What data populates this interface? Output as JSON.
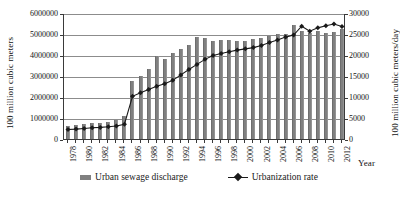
{
  "chart_data": {
    "type": "bar",
    "title": "",
    "xlabel": "Year",
    "ylabel": "100 million cubic meters",
    "y2label": "100 million cubic meters/day",
    "grid": true,
    "legend_position": "bottom",
    "ylim": [
      0,
      6000000
    ],
    "y2lim": [
      0,
      30000
    ],
    "ytick_labels": [
      "0",
      "1000000",
      "2000000",
      "3000000",
      "4000000",
      "5000000",
      "6000000"
    ],
    "ytick_values": [
      0,
      1000000,
      2000000,
      3000000,
      4000000,
      5000000,
      6000000
    ],
    "y2tick_labels": [
      "0",
      "5000",
      "10000",
      "15000",
      "20000",
      "25000",
      "30000"
    ],
    "y2tick_values": [
      0,
      5000,
      10000,
      15000,
      20000,
      25000,
      30000
    ],
    "categories": [
      1978,
      1979,
      1980,
      1981,
      1982,
      1983,
      1984,
      1985,
      1986,
      1987,
      1988,
      1989,
      1990,
      1991,
      1992,
      1993,
      1994,
      1995,
      1996,
      1997,
      1998,
      1999,
      2000,
      2001,
      2002,
      2003,
      2004,
      2005,
      2006,
      2007,
      2008,
      2009,
      2010,
      2011,
      2012
    ],
    "xtick_labels": [
      "1978",
      "1980",
      "1982",
      "1984",
      "1986",
      "1988",
      "1990",
      "1992",
      "1994",
      "1996",
      "1998",
      "2000",
      "2002",
      "2004",
      "2006",
      "2008",
      "2010",
      "2012"
    ],
    "series": [
      {
        "name": "Urban sewage discharge",
        "type": "bar",
        "axis": "left",
        "color": "#808080",
        "values": [
          620000,
          660000,
          700000,
          740000,
          780000,
          820000,
          900000,
          1100000,
          2780000,
          3000000,
          3350000,
          3930000,
          3800000,
          4100000,
          4300000,
          4470000,
          4880000,
          4790000,
          4650000,
          4700000,
          4700000,
          4680000,
          4670000,
          4750000,
          4820000,
          4900000,
          4980000,
          5020000,
          5430000,
          5160000,
          5060000,
          5120000,
          5070000,
          5100000,
          5230000
        ]
      },
      {
        "name": "Urbanization rate",
        "type": "line",
        "axis": "right",
        "color": "#1a1a1a",
        "marker": "diamond",
        "values": [
          2500,
          2600,
          2750,
          2900,
          3000,
          3150,
          3350,
          3750,
          10400,
          11250,
          12000,
          12800,
          13400,
          14200,
          15500,
          16800,
          18000,
          19200,
          20100,
          20600,
          21000,
          21400,
          21700,
          22000,
          22500,
          23200,
          23800,
          24500,
          25000,
          27100,
          25900,
          26700,
          27200,
          27600,
          27000
        ]
      }
    ]
  },
  "legend": {
    "items": [
      {
        "label": "Urban sewage discharge",
        "marker": "bar-swatch"
      },
      {
        "label": "Urbanization rate",
        "marker": "line-diamond-swatch"
      }
    ]
  },
  "colors": {
    "bar": "#808080",
    "line": "#1a1a1a",
    "grid": "#8c8c8c",
    "axis": "#3a3a3a",
    "background": "#ffffff"
  }
}
